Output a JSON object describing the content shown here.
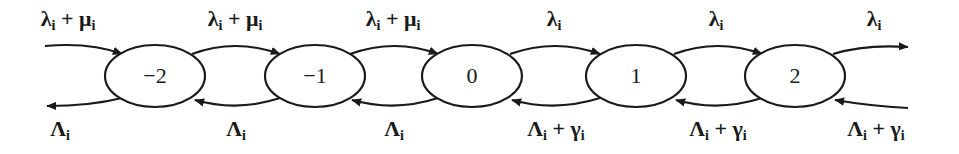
{
  "diagram": {
    "type": "birth-death state transition chain",
    "colors": {
      "ink": "#1a1a1a",
      "background": "#ffffff"
    },
    "nodes": [
      {
        "id": "n-2",
        "label": "−2",
        "cx": 155,
        "cy": 76
      },
      {
        "id": "n-1",
        "label": "−1",
        "cx": 315,
        "cy": 76
      },
      {
        "id": "n0",
        "label": "0",
        "cx": 472,
        "cy": 76
      },
      {
        "id": "n1",
        "label": "1",
        "cx": 636,
        "cy": 76
      },
      {
        "id": "n2",
        "label": "2",
        "cx": 795,
        "cy": 76
      }
    ],
    "top_edges": [
      {
        "from": "left-in",
        "to": "−2",
        "main": "λ",
        "sub": "i",
        "rest": " + μ",
        "sub2": "i"
      },
      {
        "from": "−2",
        "to": "−1",
        "main": "λ",
        "sub": "i",
        "rest": " + μ",
        "sub2": "i"
      },
      {
        "from": "−1",
        "to": "0",
        "main": "λ",
        "sub": "i",
        "rest": " + μ",
        "sub2": "i"
      },
      {
        "from": "0",
        "to": "1",
        "main": "λ",
        "sub": "i",
        "rest": "",
        "sub2": ""
      },
      {
        "from": "1",
        "to": "2",
        "main": "λ",
        "sub": "i",
        "rest": "",
        "sub2": ""
      },
      {
        "from": "2",
        "to": "right-out",
        "main": "λ",
        "sub": "i",
        "rest": "",
        "sub2": ""
      }
    ],
    "bottom_edges": [
      {
        "from": "−2",
        "to": "left-out",
        "main": "Λ",
        "sub": "i",
        "rest": "",
        "sub2": ""
      },
      {
        "from": "−1",
        "to": "−2",
        "main": "Λ",
        "sub": "i",
        "rest": "",
        "sub2": ""
      },
      {
        "from": "0",
        "to": "−1",
        "main": "Λ",
        "sub": "i",
        "rest": "",
        "sub2": ""
      },
      {
        "from": "1",
        "to": "0",
        "main": "Λ",
        "sub": "i",
        "rest": " + γ",
        "sub2": "i"
      },
      {
        "from": "2",
        "to": "1",
        "main": "Λ",
        "sub": "i",
        "rest": " + γ",
        "sub2": "i"
      },
      {
        "from": "right-in",
        "to": "2",
        "main": "Λ",
        "sub": "i",
        "rest": " + γ",
        "sub2": "i"
      }
    ]
  }
}
